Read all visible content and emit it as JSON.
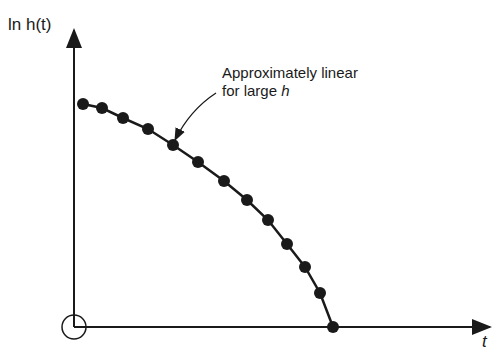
{
  "chart_data": {
    "type": "line",
    "title": "",
    "xlabel": "t",
    "ylabel": "ln h(t)",
    "grid": false,
    "legend": null,
    "annotations": [
      {
        "text_line1": "Approximately linear",
        "text_line2_prefix": "for large ",
        "text_line2_var": "h",
        "arrow_to_point": [
          173,
          145
        ]
      }
    ],
    "origin_marker": "circle",
    "series": [
      {
        "name": "ln h(t)",
        "marker": "filled-circle",
        "pixel_points": [
          [
            83,
            104
          ],
          [
            102,
            108
          ],
          [
            123,
            118
          ],
          [
            148,
            129
          ],
          [
            173,
            145
          ],
          [
            198,
            162
          ],
          [
            224,
            181
          ],
          [
            247,
            200
          ],
          [
            268,
            220
          ],
          [
            287,
            244
          ],
          [
            305,
            267
          ],
          [
            320,
            293
          ],
          [
            333,
            327
          ]
        ],
        "x": [
          1,
          2,
          3,
          4,
          5,
          6,
          7,
          8,
          9,
          10,
          11,
          12,
          13
        ],
        "y": [
          0.75,
          0.73,
          0.69,
          0.65,
          0.6,
          0.54,
          0.48,
          0.42,
          0.36,
          0.28,
          0.2,
          0.12,
          0.0
        ]
      }
    ]
  },
  "labels": {
    "y_axis": "ln h(t)",
    "x_axis": "t",
    "annotation_line1": "Approximately linear",
    "annotation_line2": "for large ",
    "annotation_var": "h"
  }
}
